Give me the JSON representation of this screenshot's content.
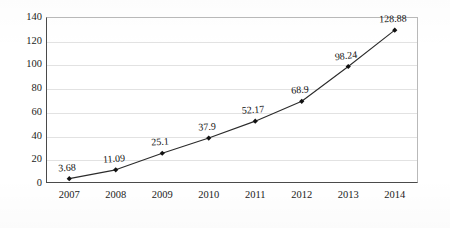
{
  "chart_data": {
    "type": "line",
    "title": "",
    "subtitle": "",
    "xlabel": "",
    "ylabel": "",
    "categories": [
      "2007",
      "2008",
      "2009",
      "2010",
      "2011",
      "2012",
      "2013",
      "2014"
    ],
    "values": [
      3.68,
      11.09,
      25.1,
      37.9,
      52.17,
      68.9,
      98.24,
      128.88
    ],
    "point_labels": [
      "3.68",
      "11.09",
      "25.1",
      "37.9",
      "52.17",
      "68.9",
      "98.24",
      "128.88"
    ],
    "series": [
      {
        "name": "",
        "values": [
          3.68,
          11.09,
          25.1,
          37.9,
          52.17,
          68.9,
          98.24,
          128.88
        ],
        "color": "#2b2b2b",
        "marker": "diamond",
        "marker_color": "#111111"
      }
    ],
    "ylim": [
      0,
      140
    ],
    "ytick_step": 20,
    "yticks": [
      "0",
      "20",
      "40",
      "60",
      "80",
      "100",
      "120",
      "140"
    ],
    "xticks": [
      "2007",
      "2008",
      "2009",
      "2010",
      "2011",
      "2012",
      "2013",
      "2014"
    ],
    "grid": true,
    "grid_axis": "y",
    "grid_color": "#e2e2e2",
    "legend": false,
    "legend_position": "none",
    "plot_background": "#ffffff",
    "axis_color": "#4a4a4a",
    "border_color": "#b9b9b9",
    "annotations": []
  }
}
